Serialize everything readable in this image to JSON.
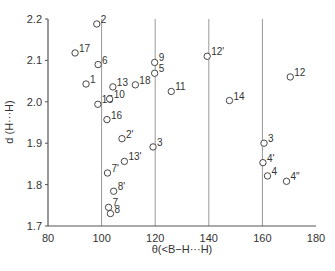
{
  "chart_data": {
    "type": "scatter",
    "title": "",
    "xlabel": "θ(<B−H···H)",
    "ylabel": "d (H···H)",
    "xlim": [
      80,
      180
    ],
    "ylim": [
      1.7,
      2.2
    ],
    "x_ticks": [
      80,
      100,
      120,
      140,
      160,
      180
    ],
    "y_ticks": [
      1.7,
      1.8,
      1.9,
      2.0,
      2.1,
      2.2
    ],
    "x_tick_labels": [
      "80",
      "100",
      "120",
      "140",
      "160",
      "180"
    ],
    "y_tick_labels": [
      "1.7",
      "1.8",
      "1.9",
      "2.0",
      "2.1",
      "2.2"
    ],
    "vertical_gridlines": [
      100,
      120,
      140,
      160
    ],
    "grid": "vertical only",
    "legend": null,
    "marker": "open circle",
    "points": [
      {
        "label": "2",
        "x": 98.2,
        "y": 2.188
      },
      {
        "label": "17",
        "x": 90.1,
        "y": 2.118
      },
      {
        "label": "6",
        "x": 98.7,
        "y": 2.09
      },
      {
        "label": "1",
        "x": 94.2,
        "y": 2.043
      },
      {
        "label": "13",
        "x": 104.2,
        "y": 2.036
      },
      {
        "label": "18",
        "x": 112.6,
        "y": 2.041
      },
      {
        "label": "9",
        "x": 119.8,
        "y": 2.095
      },
      {
        "label": "5",
        "x": 119.8,
        "y": 2.069
      },
      {
        "label": "12'",
        "x": 139.4,
        "y": 2.11
      },
      {
        "label": "12",
        "x": 170.4,
        "y": 2.06
      },
      {
        "label": "11",
        "x": 126.0,
        "y": 2.025
      },
      {
        "label": "15",
        "x": 98.6,
        "y": 1.994
      },
      {
        "label": "10",
        "x": 103.0,
        "y": 2.007
      },
      {
        "label": "14",
        "x": 147.7,
        "y": 2.003
      },
      {
        "label": "16",
        "x": 102.0,
        "y": 1.957
      },
      {
        "label": "2'",
        "x": 107.6,
        "y": 1.911
      },
      {
        "label": "3",
        "x": 119.2,
        "y": 1.891
      },
      {
        "label": "3",
        "x": 160.6,
        "y": 1.9
      },
      {
        "label": "13'",
        "x": 108.5,
        "y": 1.856
      },
      {
        "label": "7'",
        "x": 102.2,
        "y": 1.828
      },
      {
        "label": "4'",
        "x": 160.2,
        "y": 1.853
      },
      {
        "label": "4",
        "x": 161.9,
        "y": 1.821
      },
      {
        "label": "4\"",
        "x": 169.0,
        "y": 1.808
      },
      {
        "label": "8'",
        "x": 104.5,
        "y": 1.784
      },
      {
        "label": "7",
        "x": 102.6,
        "y": 1.745
      },
      {
        "label": "8",
        "x": 103.3,
        "y": 1.73
      }
    ]
  },
  "layout": {
    "plot_left": 48,
    "plot_right": 316,
    "plot_top": 19,
    "plot_bottom": 226,
    "axis_color": "#555555",
    "grid_color": "#999999",
    "marker_color": "#333333"
  }
}
